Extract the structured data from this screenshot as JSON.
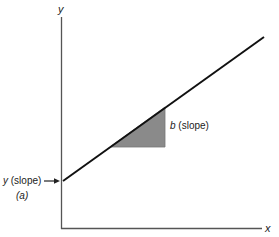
{
  "diagram": {
    "type": "linear-regression-line",
    "axes": {
      "y_label": "y",
      "x_label": "x"
    },
    "line": {
      "start": [
        63,
        181
      ],
      "end": [
        264,
        37
      ],
      "color": "#111111"
    },
    "slope_triangle": {
      "points": [
        [
          110,
          147
        ],
        [
          165,
          107
        ],
        [
          165,
          147
        ]
      ],
      "fill": "#8a8a8a",
      "label_var": "b",
      "label_text": " (slope)"
    },
    "intercept": {
      "label_var": "y",
      "label_text": " (slope)",
      "sub_label": "(a)"
    }
  }
}
